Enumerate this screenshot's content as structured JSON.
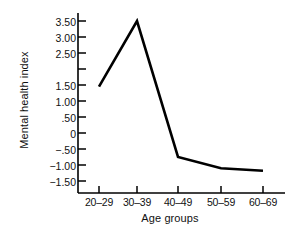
{
  "chart_data": {
    "type": "line",
    "title": "",
    "xlabel": "Age groups",
    "ylabel": "Mental health index",
    "categories": [
      "20–29",
      "30–39",
      "40–49",
      "50–59",
      "60–69"
    ],
    "values": [
      1.45,
      3.5,
      -0.75,
      -1.1,
      -1.18
    ],
    "series": [
      {
        "name": "Mental health index",
        "values": [
          1.45,
          3.5,
          -0.75,
          -1.1,
          -1.18
        ]
      }
    ],
    "ylim": [
      -1.75,
      3.75
    ],
    "ytick_values": [
      3.5,
      3.0,
      2.5,
      2.0,
      1.5,
      1.0,
      0.5,
      0,
      -0.5,
      -1.0,
      -1.5
    ],
    "ytick_labels": [
      "3.50",
      "3.00",
      "2.50",
      "",
      "1.50",
      "1.00",
      ".50",
      "0",
      "−.50",
      "−1.00",
      "−1.50"
    ],
    "grid": false,
    "legend": null,
    "line_color": "#000000",
    "axis_color": "#000000",
    "background_color": "#ffffff"
  },
  "axes": {
    "y_axis_title": "Mental health index",
    "x_axis_title": "Age groups"
  },
  "ticks": {
    "y": [
      {
        "label": "3.50",
        "value": 3.5
      },
      {
        "label": "3.00",
        "value": 3.0
      },
      {
        "label": "2.50",
        "value": 2.5
      },
      {
        "label": "",
        "value": 2.0
      },
      {
        "label": "1.50",
        "value": 1.5
      },
      {
        "label": "1.00",
        "value": 1.0
      },
      {
        "label": ".50",
        "value": 0.5
      },
      {
        "label": "0",
        "value": 0
      },
      {
        "label": "−.50",
        "value": -0.5
      },
      {
        "label": "−1.00",
        "value": -1.0
      },
      {
        "label": "−1.50",
        "value": -1.5
      }
    ],
    "x": [
      {
        "label": "20–29"
      },
      {
        "label": "30–39"
      },
      {
        "label": "40–49"
      },
      {
        "label": "50–59"
      },
      {
        "label": "60–69"
      }
    ]
  }
}
